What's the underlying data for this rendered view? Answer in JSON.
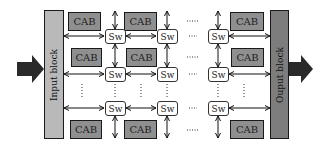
{
  "diagram": {
    "input_block": {
      "label": "Input block",
      "fill": "#b9b9b9"
    },
    "output_block": {
      "label": "Ouput block",
      "fill": "#7d7d7d"
    },
    "cab_label": "CAB",
    "switch_label": "Sw",
    "cab_fill": "#8f8f8f",
    "arrow_fill": "#2a2a2a",
    "ellipsis": "......",
    "short_ellipsis": "....",
    "cabs": [
      {
        "id": "cab-r1-c1",
        "label": "CAB"
      },
      {
        "id": "cab-r1-c2",
        "label": "CAB"
      },
      {
        "id": "cab-r1-c3",
        "label": "CAB"
      },
      {
        "id": "cab-r2-c1",
        "label": "CAB"
      },
      {
        "id": "cab-r2-c2",
        "label": "CAB"
      },
      {
        "id": "cab-r2-c3",
        "label": "CAB"
      },
      {
        "id": "cab-r3-c1",
        "label": "CAB"
      },
      {
        "id": "cab-r3-c2",
        "label": "CAB"
      },
      {
        "id": "cab-r3-c3",
        "label": "CAB"
      }
    ],
    "switches": [
      {
        "id": "sw-r1-c1",
        "label": "Sw"
      },
      {
        "id": "sw-r1-c2",
        "label": "Sw"
      },
      {
        "id": "sw-r1-c3",
        "label": "Sw"
      },
      {
        "id": "sw-r2-c1",
        "label": "Sw"
      },
      {
        "id": "sw-r2-c2",
        "label": "Sw"
      },
      {
        "id": "sw-r2-c3",
        "label": "Sw"
      },
      {
        "id": "sw-r3-c1",
        "label": "Sw"
      },
      {
        "id": "sw-r3-c2",
        "label": "Sw"
      },
      {
        "id": "sw-r3-c3",
        "label": "Sw"
      }
    ]
  }
}
